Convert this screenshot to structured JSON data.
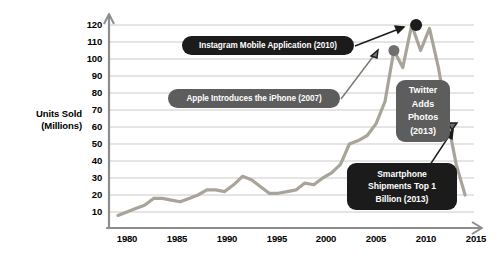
{
  "chart_data": {
    "type": "line",
    "title": "",
    "xlabel": "",
    "ylabel": "Units Sold (Millions)",
    "ylabel_lines": [
      "Units Sold",
      "(Millions)"
    ],
    "xlim": [
      1977,
      2018
    ],
    "ylim": [
      0,
      125
    ],
    "grid": true,
    "legend": "none",
    "yticks": [
      120,
      110,
      100,
      90,
      80,
      70,
      60,
      50,
      40,
      30,
      20,
      10
    ],
    "xticks": [
      1980,
      1985,
      1990,
      1995,
      2000,
      2005,
      2010,
      2015
    ],
    "series": [
      {
        "name": "Units Sold",
        "color": "#a9a49a",
        "x": [
          1978,
          1979,
          1980,
          1981,
          1982,
          1983,
          1984,
          1985,
          1986,
          1987,
          1988,
          1989,
          1990,
          1991,
          1992,
          1993,
          1994,
          1995,
          1996,
          1997,
          1998,
          1999,
          2000,
          2001,
          2002,
          2003,
          2004,
          2005,
          2006,
          2007,
          2008,
          2009,
          2010,
          2011,
          2012,
          2013,
          2014,
          2015,
          2016,
          2017
        ],
        "values": [
          8,
          10,
          12,
          14,
          18,
          18,
          17,
          16,
          18,
          20,
          23,
          23,
          22,
          26,
          31,
          29,
          25,
          21,
          21,
          22,
          23,
          27,
          26,
          30,
          33,
          38,
          50,
          52,
          55,
          62,
          75,
          105,
          95,
          120,
          105,
          118,
          95,
          65,
          38,
          20
        ]
      }
    ],
    "markers": [
      {
        "name": "iphone-marker",
        "x": 2009,
        "y": 105,
        "color": "#6f6f6f",
        "radius": 5.5
      },
      {
        "name": "instagram-marker",
        "x": 2011.5,
        "y": 120,
        "color": "#1b1b1b",
        "radius": 6
      },
      {
        "name": "shipments-marker",
        "x": 2014.5,
        "y": 65,
        "color": "#1b1b1b",
        "radius": 6
      }
    ],
    "annotations": [
      {
        "id": "instagram",
        "label": "Instagram Mobile Application (2010)",
        "style": "dark",
        "event_year": 2010
      },
      {
        "id": "iphone",
        "label": "Apple Introduces the iPhone (2007)",
        "style": "gray",
        "event_year": 2007
      },
      {
        "id": "twitter",
        "label": "Twitter Adds Photos (2013)",
        "lines": [
          "Twitter",
          "Adds",
          "Photos",
          "(2013)"
        ],
        "style": "gray",
        "event_year": 2013
      },
      {
        "id": "smartphone",
        "label": "Smartphone Shipments Top 1 Billion (2013)",
        "lines": [
          "Smartphone",
          "Shipments Top 1",
          "Billion (2013)"
        ],
        "style": "dark",
        "event_year": 2013
      }
    ],
    "colors": {
      "line": "#a9a49a",
      "grid": "#b9b9b9",
      "axis": "#8d8d8d",
      "callout_dark": "#1b1b1b",
      "callout_gray": "#5d5d5d",
      "background": "#ffffff"
    }
  }
}
